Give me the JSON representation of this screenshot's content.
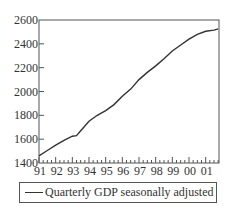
{
  "chart_data": {
    "type": "line",
    "title": "",
    "xlabel": "",
    "ylabel": "",
    "x_tick_labels": [
      "91",
      "92",
      "93",
      "94",
      "95",
      "96",
      "97",
      "98",
      "99",
      "00",
      "01"
    ],
    "y_tick_labels": [
      "1400",
      "1600",
      "1800",
      "2000",
      "2200",
      "2400",
      "2600"
    ],
    "ylim": [
      1400,
      2600
    ],
    "grid": false,
    "legend_position": "bottom",
    "series": [
      {
        "name": "Quarterly GDP seasonally adjusted",
        "color": "#333333",
        "x": [
          1991.0,
          1991.5,
          1992.0,
          1992.5,
          1993.0,
          1993.25,
          1993.5,
          1994.0,
          1994.5,
          1995.0,
          1995.5,
          1996.0,
          1996.5,
          1997.0,
          1997.5,
          1998.0,
          1998.5,
          1999.0,
          1999.5,
          2000.0,
          2000.5,
          2001.0,
          2001.5,
          2001.75
        ],
        "values": [
          1460,
          1505,
          1550,
          1590,
          1625,
          1630,
          1670,
          1750,
          1800,
          1840,
          1890,
          1960,
          2020,
          2100,
          2160,
          2215,
          2275,
          2340,
          2390,
          2440,
          2480,
          2505,
          2515,
          2525
        ]
      }
    ]
  },
  "legend": {
    "label": "Quarterly GDP seasonally adjusted"
  }
}
